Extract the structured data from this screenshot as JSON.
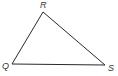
{
  "diagram": {
    "type": "triangle",
    "stroke_color": "#2a2a2a",
    "vertices": [
      {
        "name": "R",
        "label": "R",
        "x": 43,
        "y": 12
      },
      {
        "name": "Q",
        "label": "Q",
        "x": 12,
        "y": 64
      },
      {
        "name": "S",
        "label": "S",
        "x": 105,
        "y": 65
      }
    ],
    "edges": [
      [
        "Q",
        "R"
      ],
      [
        "R",
        "S"
      ],
      [
        "Q",
        "S"
      ]
    ]
  }
}
